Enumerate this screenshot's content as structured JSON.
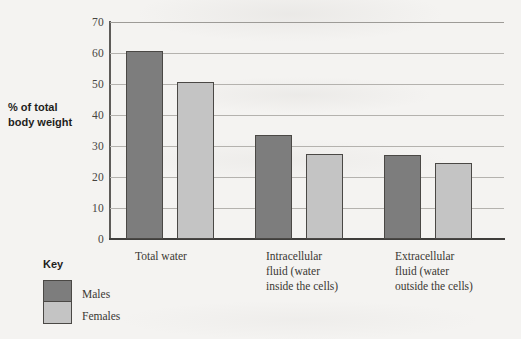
{
  "axis": {
    "y_label": "% of total\nbody weight",
    "y_label_line1": "% of total",
    "y_label_line2": "body weight",
    "y_ticks": [
      "70",
      "60",
      "50",
      "40",
      "30",
      "20",
      "10",
      "0"
    ]
  },
  "key": {
    "title": "Key",
    "entries": [
      {
        "label": "Males",
        "color": "#7d7d7d"
      },
      {
        "label": "Females",
        "color": "#c4c4c4"
      }
    ]
  },
  "categories": [
    {
      "line1": "Total water",
      "line2": "",
      "line3": ""
    },
    {
      "line1": "Intracellular",
      "line2": "fluid (water",
      "line3": "inside the cells)"
    },
    {
      "line1": "Extracellular",
      "line2": "fluid  (water",
      "line3": "outside the cells)"
    }
  ],
  "chart_data": {
    "type": "bar",
    "title": "",
    "xlabel": "",
    "ylabel": "% of total body weight",
    "ylim": [
      0,
      70
    ],
    "ytick_step": 10,
    "grid": true,
    "legend_position": "bottom-left",
    "categories": [
      "Total water",
      "Intracellular fluid (water inside the cells)",
      "Extracellular fluid (water outside the cells)"
    ],
    "series": [
      {
        "name": "Males",
        "color": "#7d7d7d",
        "values": [
          60.5,
          33.5,
          27
        ]
      },
      {
        "name": "Females",
        "color": "#c4c4c4",
        "values": [
          50.5,
          27.5,
          24.5
        ]
      }
    ]
  }
}
